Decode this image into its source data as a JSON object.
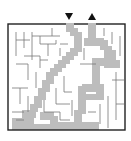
{
  "maze": {
    "entrance_marker": "down-arrow",
    "exit_marker": "up-arrow",
    "colors": {
      "wall": "#555555",
      "solution": "#b8b8b8",
      "background": "#ffffff"
    }
  }
}
